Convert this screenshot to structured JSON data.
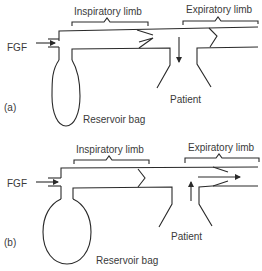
{
  "panels": [
    {
      "id": "a",
      "label": "(a)",
      "inspiratory_label": "Inspiratory limb",
      "expiratory_label": "Expiratory limb",
      "fgf_label": "FGF",
      "patient_label": "Patient",
      "bag_label": "Reservoir bag",
      "flow_direction": "downward arrow into patient (inspiration)"
    },
    {
      "id": "b",
      "label": "(b)",
      "inspiratory_label": "Inspiratory limb",
      "expiratory_label": "Expiratory limb",
      "fgf_label": "FGF",
      "patient_label": "Patient",
      "bag_label": "Reservoir bag",
      "flow_direction": "upward arrow from patient, rightward arrow through expiratory valve (expiration)"
    }
  ],
  "colors": {
    "line": "#2a2a2a",
    "text": "#3a3a3a",
    "background": "#ffffff"
  }
}
